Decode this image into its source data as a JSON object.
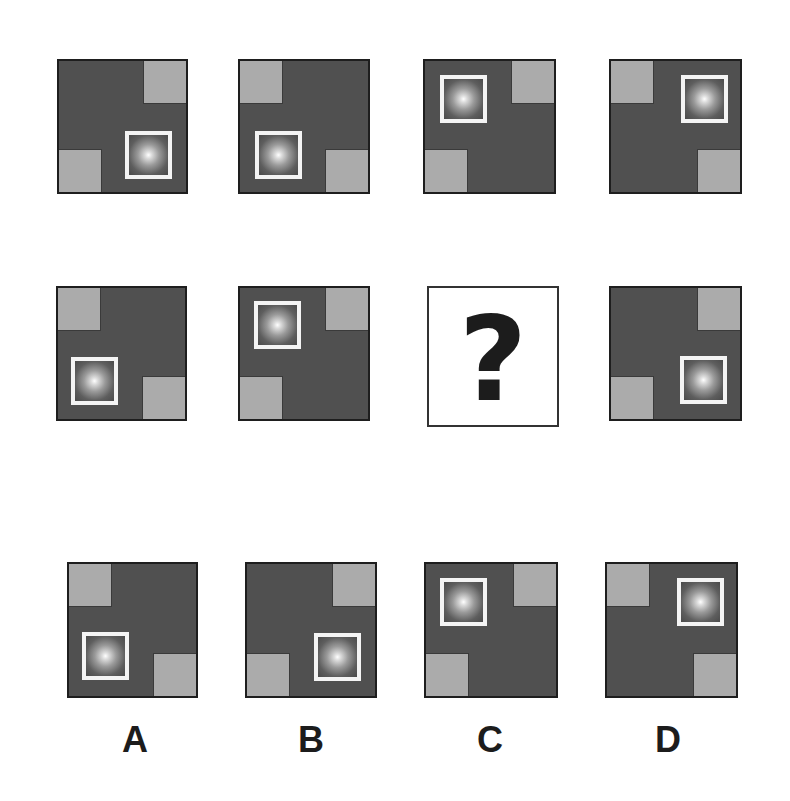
{
  "puzzle": {
    "grid": [
      {
        "row": 1,
        "col": 1,
        "gray_corners": [
          "tr",
          "bl"
        ],
        "framed_glow": "bottom-right"
      },
      {
        "row": 1,
        "col": 2,
        "gray_corners": [
          "tl",
          "br"
        ],
        "framed_glow": "bottom-left"
      },
      {
        "row": 1,
        "col": 3,
        "gray_corners": [
          "tr",
          "bl"
        ],
        "framed_glow": "top-left"
      },
      {
        "row": 1,
        "col": 4,
        "gray_corners": [
          "tl",
          "br"
        ],
        "framed_glow": "top-right"
      },
      {
        "row": 2,
        "col": 1,
        "gray_corners": [
          "tl",
          "br"
        ],
        "framed_glow": "bottom-left"
      },
      {
        "row": 2,
        "col": 2,
        "gray_corners": [
          "tr",
          "bl"
        ],
        "framed_glow": "top-left"
      },
      {
        "row": 2,
        "col": 3,
        "missing": true,
        "symbol": "?"
      },
      {
        "row": 2,
        "col": 4,
        "gray_corners": [
          "tr",
          "bl"
        ],
        "framed_glow": "bottom-right"
      }
    ],
    "question_symbol": "?",
    "options": [
      {
        "label": "A",
        "gray_corners": [
          "tl",
          "br"
        ],
        "framed_glow": "bottom-left"
      },
      {
        "label": "B",
        "gray_corners": [
          "tr",
          "bl"
        ],
        "framed_glow": "bottom-right"
      },
      {
        "label": "C",
        "gray_corners": [
          "tr",
          "bl"
        ],
        "framed_glow": "top-left"
      },
      {
        "label": "D",
        "gray_corners": [
          "tl",
          "br"
        ],
        "framed_glow": "top-right"
      }
    ],
    "colors": {
      "tile_background": "#505050",
      "gray_square": "#ababab",
      "frame": "#f4f4f4",
      "page_background": "#ffffff"
    }
  }
}
